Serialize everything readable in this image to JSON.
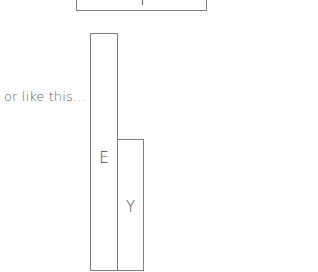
{
  "diagram": {
    "caption": "or like this...",
    "top_box": {
      "label": "",
      "partial": true
    },
    "bars": [
      {
        "label": "E",
        "relative_height": 1.0
      },
      {
        "label": "Y",
        "relative_height": 0.55
      }
    ],
    "colors": {
      "border": "#7f7f7f",
      "text": "#555555",
      "background": "#ffffff"
    }
  }
}
